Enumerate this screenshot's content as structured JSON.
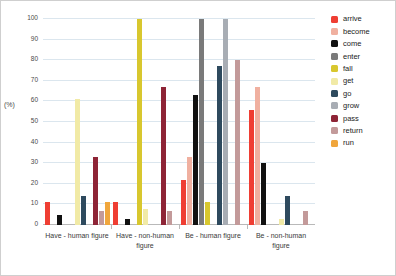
{
  "chart_data": {
    "type": "bar",
    "title": "",
    "xlabel": "",
    "ylabel": "(%)",
    "ylim": [
      0,
      100
    ],
    "grid": true,
    "legend_position": "right",
    "categories": [
      "Have - human figure",
      "Have - non-human figure",
      "Be - human figure",
      "Be - non-human figure"
    ],
    "yticks": [
      0,
      10,
      20,
      30,
      40,
      50,
      60,
      70,
      80,
      90,
      100
    ],
    "series": [
      {
        "name": "arrive",
        "color": "#ef3e33",
        "values": [
          11,
          11,
          22,
          56
        ]
      },
      {
        "name": "become",
        "color": "#f0b0a0",
        "values": [
          0,
          0,
          33,
          67
        ]
      },
      {
        "name": "come",
        "color": "#111111",
        "values": [
          5,
          3,
          63,
          30
        ]
      },
      {
        "name": "enter",
        "color": "#7a7a7a",
        "values": [
          0,
          0,
          100,
          0
        ]
      },
      {
        "name": "fall",
        "color": "#d8c72e",
        "values": [
          0,
          100,
          11,
          0
        ]
      },
      {
        "name": "get",
        "color": "#f1eaa6",
        "values": [
          61,
          8,
          0,
          3
        ]
      },
      {
        "name": "go",
        "color": "#2e4a5e",
        "values": [
          14,
          0,
          77,
          14
        ]
      },
      {
        "name": "grow",
        "color": "#a8adb4",
        "values": [
          0,
          0,
          100,
          0
        ]
      },
      {
        "name": "pass",
        "color": "#8e2436",
        "values": [
          33,
          67,
          0,
          0
        ]
      },
      {
        "name": "return",
        "color": "#c39a9a",
        "values": [
          7,
          7,
          80,
          7
        ]
      },
      {
        "name": "run",
        "color": "#f0a63c",
        "values": [
          11,
          0,
          0,
          0
        ]
      }
    ]
  }
}
